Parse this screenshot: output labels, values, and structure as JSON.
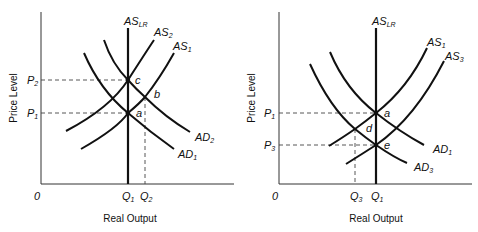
{
  "diagrams": [
    {
      "id": "left",
      "title": "",
      "y_axis_label": "Price Level",
      "x_axis_label": "Real Output",
      "origin_label": "0",
      "curves": [
        {
          "name": "AS",
          "sub": "LR",
          "type": "vertical"
        },
        {
          "name": "AS",
          "sub": "2",
          "type": "upward"
        },
        {
          "name": "AS",
          "sub": "1",
          "type": "upward"
        },
        {
          "name": "AD",
          "sub": "2",
          "type": "downward"
        },
        {
          "name": "AD",
          "sub": "1",
          "type": "downward"
        }
      ],
      "price_levels": [
        {
          "name": "P",
          "sub": "2"
        },
        {
          "name": "P",
          "sub": "1"
        }
      ],
      "quantities": [
        {
          "name": "Q",
          "sub": "1"
        },
        {
          "name": "Q",
          "sub": "2"
        }
      ],
      "points": [
        "c",
        "b",
        "a"
      ]
    },
    {
      "id": "right",
      "title": "",
      "y_axis_label": "Price Level",
      "x_axis_label": "Real Output",
      "origin_label": "0",
      "curves": [
        {
          "name": "AS",
          "sub": "LR",
          "type": "vertical"
        },
        {
          "name": "AS",
          "sub": "1",
          "type": "upward"
        },
        {
          "name": "AS",
          "sub": "3",
          "type": "upward"
        },
        {
          "name": "AD",
          "sub": "1",
          "type": "downward"
        },
        {
          "name": "AD",
          "sub": "3",
          "type": "downward"
        }
      ],
      "price_levels": [
        {
          "name": "P",
          "sub": "1"
        },
        {
          "name": "P",
          "sub": "3"
        }
      ],
      "quantities": [
        {
          "name": "Q",
          "sub": "3"
        },
        {
          "name": "Q",
          "sub": "1"
        }
      ],
      "points": [
        "a",
        "d",
        "e"
      ]
    }
  ]
}
